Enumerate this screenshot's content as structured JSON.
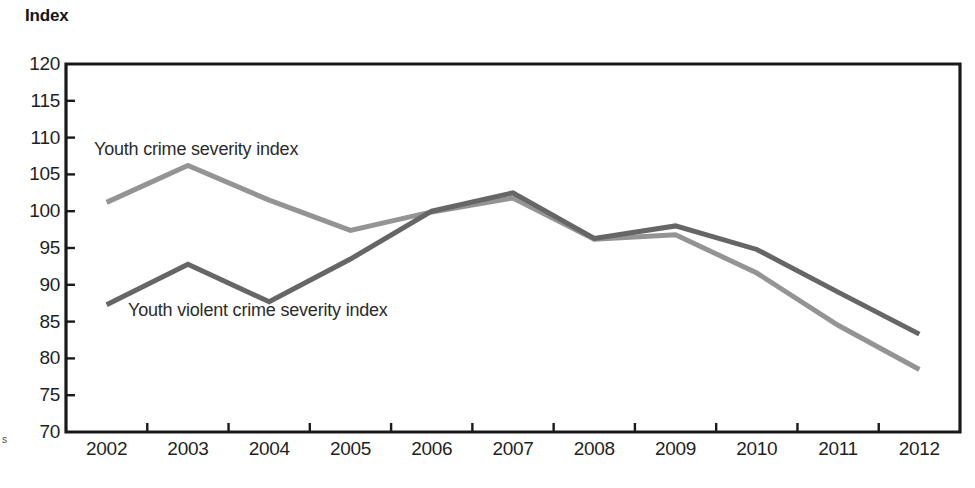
{
  "chart_data": {
    "type": "line",
    "title": "",
    "ylabel": "Index",
    "xlabel": "",
    "ylim": [
      70,
      120
    ],
    "yticks": [
      70,
      75,
      80,
      85,
      90,
      95,
      100,
      105,
      110,
      115,
      120
    ],
    "categories": [
      "2002",
      "2003",
      "2004",
      "2005",
      "2006",
      "2007",
      "2008",
      "2009",
      "2010",
      "2011",
      "2012"
    ],
    "grid": false,
    "legend_position": "inline-annotations",
    "series": [
      {
        "name": "Youth crime severity index",
        "color": "#949494",
        "values": [
          101.2,
          106.2,
          101.5,
          97.4,
          99.9,
          101.8,
          96.2,
          96.8,
          91.6,
          84.5,
          78.5
        ]
      },
      {
        "name": "Youth violent crime severity index",
        "color": "#666666",
        "values": [
          87.3,
          92.8,
          87.7,
          93.5,
          100.0,
          102.5,
          96.3,
          98.0,
          94.8,
          89.0,
          83.3
        ]
      }
    ],
    "annotations": [
      {
        "text": "Youth crime severity index",
        "series": 0
      },
      {
        "text": "Youth violent crime severity index",
        "series": 1
      }
    ]
  },
  "axis": {
    "y_title": "Index",
    "y_tick_labels": [
      "120",
      "115",
      "110",
      "105",
      "100",
      "95",
      "90",
      "85",
      "80",
      "75",
      "70"
    ],
    "x_tick_labels": [
      "2002",
      "2003",
      "2004",
      "2005",
      "2006",
      "2007",
      "2008",
      "2009",
      "2010",
      "2011",
      "2012"
    ]
  },
  "artifacts": {
    "left_edge_mark": "s"
  },
  "colors": {
    "frame": "#1a1a1a",
    "series_light": "#949494",
    "series_dark": "#666666",
    "text": "#1f1f1f"
  }
}
